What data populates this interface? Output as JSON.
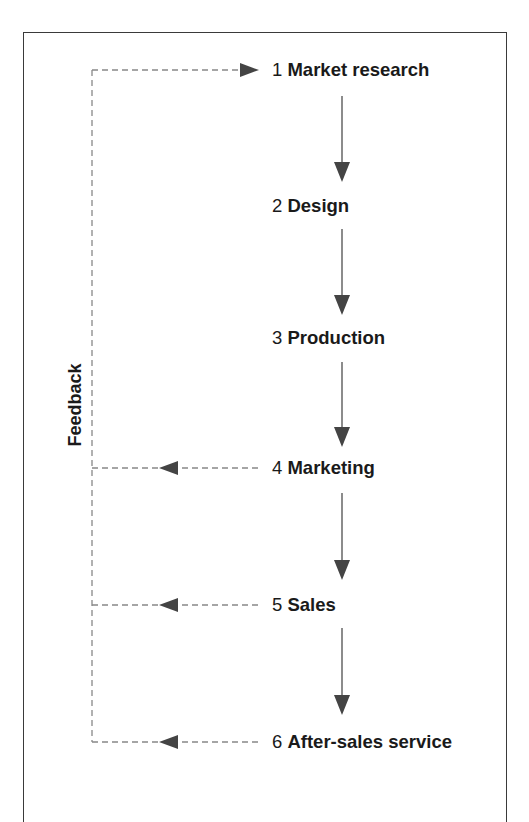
{
  "diagram": {
    "feedback_label": "Feedback",
    "steps": [
      {
        "number": "1",
        "name": "Market research",
        "top": 59
      },
      {
        "number": "2",
        "name": "Design",
        "top": 195
      },
      {
        "number": "3",
        "name": "Production",
        "top": 327
      },
      {
        "number": "4",
        "name": "Marketing",
        "top": 457
      },
      {
        "number": "5",
        "name": "Sales",
        "top": 594
      },
      {
        "number": "6",
        "name": "After-sales service",
        "top": 731
      }
    ],
    "colors": {
      "text": "#1a1a1a",
      "arrow_line": "#666666",
      "arrowhead": "#444444",
      "dashed_line": "#888888",
      "frame": "#3a3a3a"
    }
  }
}
